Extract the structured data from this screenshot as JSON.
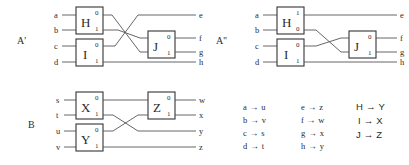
{
  "figure": {
    "background": "#ffffff",
    "wire_color": "#555555",
    "gate_border_color": "#333333",
    "text_color": "#2b2b2b"
  },
  "circuits": [
    {
      "id": "A-prime",
      "label": "A'",
      "inputs": [
        "a",
        "b",
        "c",
        "d"
      ],
      "outputs": [
        "e",
        "f",
        "g",
        "h"
      ],
      "gates": [
        {
          "name": "H",
          "sup": "0",
          "sub": "1"
        },
        {
          "name": "I",
          "sup": "0",
          "sub": "1"
        },
        {
          "name": "J",
          "sup": "0",
          "sub": "1"
        }
      ]
    },
    {
      "id": "A-double-prime",
      "label": "A''",
      "inputs": [
        "a",
        "b",
        "c",
        "d"
      ],
      "outputs": [
        "e",
        "f",
        "g",
        "h"
      ],
      "gates": [
        {
          "name": "H",
          "sup": "1",
          "sub": "0"
        },
        {
          "name": "I",
          "sup": "0",
          "sub": "1"
        },
        {
          "name": "J",
          "sup": "0",
          "sub": "1"
        }
      ]
    },
    {
      "id": "B",
      "label": "B",
      "inputs": [
        "s",
        "t",
        "u",
        "v"
      ],
      "outputs": [
        "w",
        "x",
        "y",
        "z"
      ],
      "gates": [
        {
          "name": "X",
          "sup": "0",
          "sub": "1"
        },
        {
          "name": "Y",
          "sup": "0",
          "sub": "1"
        },
        {
          "name": "Z",
          "sup": "0",
          "sub": "1"
        }
      ]
    }
  ],
  "mapping": {
    "arrow": "→",
    "columns": [
      {
        "id": "wire-map-left",
        "rows": [
          {
            "from": "a",
            "to": "u"
          },
          {
            "from": "b",
            "to": "v"
          },
          {
            "from": "c",
            "to": "s"
          },
          {
            "from": "d",
            "to": "t"
          }
        ]
      },
      {
        "id": "wire-map-right",
        "rows": [
          {
            "from": "e",
            "to": "z"
          },
          {
            "from": "f",
            "to": "w"
          },
          {
            "from": "g",
            "to": "x"
          },
          {
            "from": "h",
            "to": "y"
          }
        ]
      },
      {
        "id": "gate-map",
        "rows": [
          {
            "from": "H",
            "to": "Y"
          },
          {
            "from": "I",
            "to": "X"
          },
          {
            "from": "J",
            "to": "Z"
          }
        ]
      }
    ]
  }
}
